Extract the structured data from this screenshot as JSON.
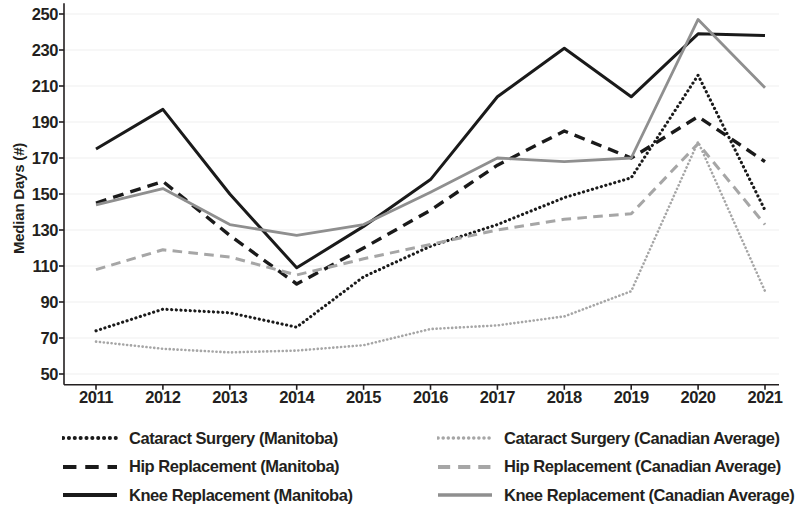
{
  "chart_data": {
    "type": "line",
    "title": "",
    "xlabel": "",
    "ylabel": "Median Days (#)",
    "x": [
      2011,
      2012,
      2013,
      2014,
      2015,
      2016,
      2017,
      2018,
      2019,
      2020,
      2021
    ],
    "xtick_labels": [
      "2011",
      "2012",
      "2013",
      "2014",
      "2015",
      "2016",
      "2017",
      "2018",
      "2019",
      "2020",
      "2021"
    ],
    "ytick_labels": [
      "250",
      "230",
      "210",
      "190",
      "170",
      "150",
      "130",
      "110",
      "90",
      "70",
      "50"
    ],
    "yticks": [
      250,
      230,
      210,
      190,
      170,
      150,
      130,
      110,
      90,
      70,
      50
    ],
    "ylim": [
      44,
      256
    ],
    "grid": true,
    "legend_position": "bottom",
    "series": [
      {
        "name": "Cataract Surgery (Manitoba)",
        "style": "dotted",
        "color": "#1a1a1a",
        "width": 3.1,
        "values": [
          74,
          86,
          84,
          76,
          104,
          121,
          133,
          148,
          159,
          216,
          141
        ]
      },
      {
        "name": "Hip Replacement (Manitoba)",
        "style": "dashed",
        "color": "#1a1a1a",
        "width": 3.4,
        "values": [
          145,
          157,
          127,
          100,
          120,
          141,
          166,
          185,
          170,
          193,
          168
        ]
      },
      {
        "name": "Knee Replacement (Manitoba)",
        "style": "solid",
        "color": "#1a1a1a",
        "width": 3.0,
        "values": [
          175,
          197,
          150,
          109,
          132,
          158,
          204,
          231,
          204,
          239,
          238
        ]
      },
      {
        "name": "Cataract Surgery (Canadian Average)",
        "style": "dotted",
        "color": "#a6a6a6",
        "width": 2.6,
        "values": [
          68,
          64,
          62,
          63,
          66,
          75,
          77,
          82,
          96,
          179,
          96
        ]
      },
      {
        "name": "Hip Replacement (Canadian Average)",
        "style": "dashed",
        "color": "#a6a6a6",
        "width": 3.0,
        "values": [
          108,
          119,
          115,
          105,
          114,
          122,
          130,
          136,
          139,
          178,
          133
        ]
      },
      {
        "name": "Knee Replacement (Canadian Average)",
        "style": "solid",
        "color": "#8f8f8f",
        "width": 2.8,
        "values": [
          144,
          153,
          133,
          127,
          133,
          151,
          170,
          168,
          170,
          247,
          209
        ]
      }
    ]
  },
  "legend": {
    "left_column": [
      "Cataract Surgery (Manitoba)",
      "Hip Replacement (Manitoba)",
      "Knee Replacement (Manitoba)"
    ],
    "right_column": [
      "Cataract Surgery (Canadian Average)",
      "Hip Replacement (Canadian Average)",
      "Knee Replacement (Canadian Average)"
    ]
  },
  "colors": {
    "manitoba": "#1a1a1a",
    "canadian_average": "#a6a6a6",
    "axis": "#231f20",
    "grid": "#efefef",
    "background": "#ffffff"
  }
}
